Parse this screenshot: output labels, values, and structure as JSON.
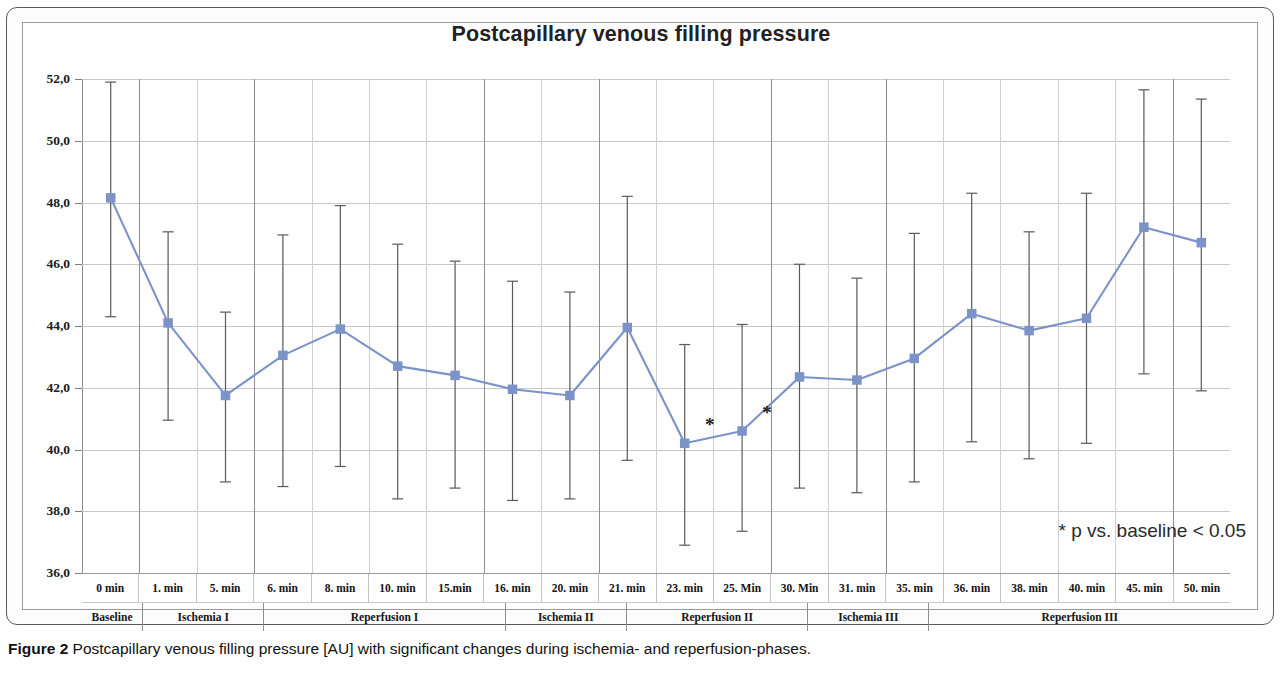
{
  "chart_data": {
    "type": "line",
    "title": "Postcapillary venous filling pressure",
    "xlabel": "",
    "ylabel": "",
    "ylim": [
      36.0,
      52.0
    ],
    "ytick_step": 2.0,
    "grid": true,
    "legend": false,
    "series_color": "#7B93C8",
    "errorbar_color": "#595959",
    "categories": [
      "0 min",
      "1. min",
      "5. min",
      "6. min",
      "8. min",
      "10. min",
      "15.min",
      "16. min",
      "20. min",
      "21. min",
      "23. min",
      "25. Min",
      "30. Min",
      "31. min",
      "35. min",
      "36. min",
      "38. min",
      "40. min",
      "45. min",
      "50. min"
    ],
    "category_groups": [
      {
        "label": "Baseline",
        "span": 1
      },
      {
        "label": "Ischemia I",
        "span": 2
      },
      {
        "label": "Reperfusion I",
        "span": 4
      },
      {
        "label": "Ischemia II",
        "span": 2
      },
      {
        "label": "Reperfusion II",
        "span": 3
      },
      {
        "label": "Ischemia III",
        "span": 2
      },
      {
        "label": "Reperfusion III",
        "span": 5
      }
    ],
    "ytick_labels": [
      "52,0",
      "50,0",
      "48,0",
      "46,0",
      "44,0",
      "42,0",
      "40,0",
      "38,0",
      "36,0"
    ],
    "ytick_values": [
      52.0,
      50.0,
      48.0,
      46.0,
      44.0,
      42.0,
      40.0,
      38.0,
      36.0
    ],
    "values": [
      48.15,
      44.1,
      41.75,
      43.05,
      43.9,
      42.7,
      42.4,
      41.95,
      41.75,
      43.95,
      40.2,
      40.6,
      42.35,
      42.25,
      42.95,
      44.4,
      43.85,
      44.25,
      47.2,
      46.7
    ],
    "err_upper": [
      51.9,
      47.05,
      44.45,
      46.95,
      47.9,
      46.65,
      46.1,
      45.45,
      45.1,
      48.2,
      43.4,
      44.05,
      46.0,
      45.55,
      47.0,
      48.3,
      47.05,
      48.3,
      51.65,
      51.35
    ],
    "err_lower": [
      44.3,
      40.95,
      38.95,
      38.8,
      39.45,
      38.4,
      38.75,
      38.35,
      38.4,
      39.65,
      36.9,
      37.35,
      38.75,
      38.6,
      38.95,
      40.25,
      39.7,
      40.2,
      42.45,
      41.9
    ],
    "significant_indices": [
      10,
      11
    ],
    "significance_marker": "*",
    "annotation": "* p vs. baseline < 0.05"
  },
  "caption": {
    "label": "Figure 2",
    "text": " Postcapillary venous filling pressure [AU] with significant changes during ischemia- and reperfusion-phases."
  }
}
